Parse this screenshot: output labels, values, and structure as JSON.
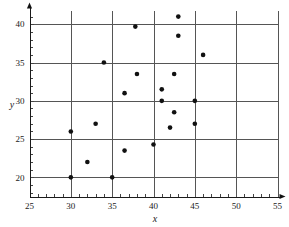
{
  "chart_data": {
    "type": "scatter",
    "title": "",
    "xlabel": "x",
    "ylabel": "y",
    "xlim": [
      25,
      55
    ],
    "ylim": [
      17.5,
      41.8
    ],
    "xticks": [
      25,
      30,
      35,
      40,
      45,
      50,
      55
    ],
    "yticks": [
      20,
      25,
      30,
      35,
      40
    ],
    "xtick_labels": [
      "25",
      "30",
      "35",
      "40",
      "45",
      "50",
      "55"
    ],
    "ytick_labels": [
      "20",
      "25",
      "30",
      "35",
      "40"
    ],
    "x_minor_tick_step": 1,
    "y_minor_tick_step": 1,
    "grid": true,
    "grid_color": "#555555",
    "legend": null,
    "marker_color": "#111111",
    "marker_size": 3,
    "points": [
      {
        "x": 30,
        "y": 20
      },
      {
        "x": 30,
        "y": 26
      },
      {
        "x": 32,
        "y": 22
      },
      {
        "x": 33,
        "y": 27
      },
      {
        "x": 34,
        "y": 35
      },
      {
        "x": 35,
        "y": 20
      },
      {
        "x": 36.5,
        "y": 23.5
      },
      {
        "x": 36.5,
        "y": 31
      },
      {
        "x": 37.8,
        "y": 39.7
      },
      {
        "x": 38,
        "y": 33.5
      },
      {
        "x": 40,
        "y": 24.3
      },
      {
        "x": 41,
        "y": 30
      },
      {
        "x": 41,
        "y": 31.5
      },
      {
        "x": 42,
        "y": 26.5
      },
      {
        "x": 42.5,
        "y": 28.5
      },
      {
        "x": 42.5,
        "y": 33.5
      },
      {
        "x": 43,
        "y": 38.5
      },
      {
        "x": 43,
        "y": 41
      },
      {
        "x": 45,
        "y": 27
      },
      {
        "x": 45,
        "y": 30
      },
      {
        "x": 46,
        "y": 36
      }
    ]
  }
}
